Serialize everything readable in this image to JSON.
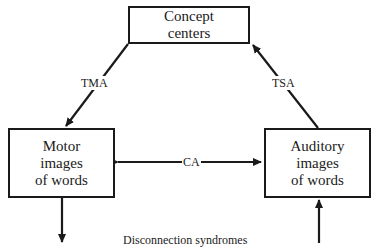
{
  "diagram": {
    "nodes": {
      "concept": {
        "lines": [
          "Concept",
          "centers"
        ]
      },
      "motor": {
        "lines": [
          "Motor",
          "images",
          "of words"
        ]
      },
      "auditory": {
        "lines": [
          "Auditory",
          "images",
          "of words"
        ]
      }
    },
    "edges": {
      "tma": {
        "label": "TMA",
        "from": "concept",
        "to": "motor"
      },
      "tsa": {
        "label": "TSA",
        "from": "auditory",
        "to": "concept"
      },
      "ca": {
        "label": "CA",
        "from": "motor",
        "to": "auditory",
        "bidirectional": true
      },
      "motor_out": {
        "label": "",
        "from": "motor",
        "to": "output"
      },
      "auditory_in": {
        "label": "",
        "from": "input",
        "to": "auditory"
      }
    },
    "caption": "Disconnection syndromes",
    "colors": {
      "stroke": "#1a1a1a",
      "background": "#ffffff"
    }
  }
}
